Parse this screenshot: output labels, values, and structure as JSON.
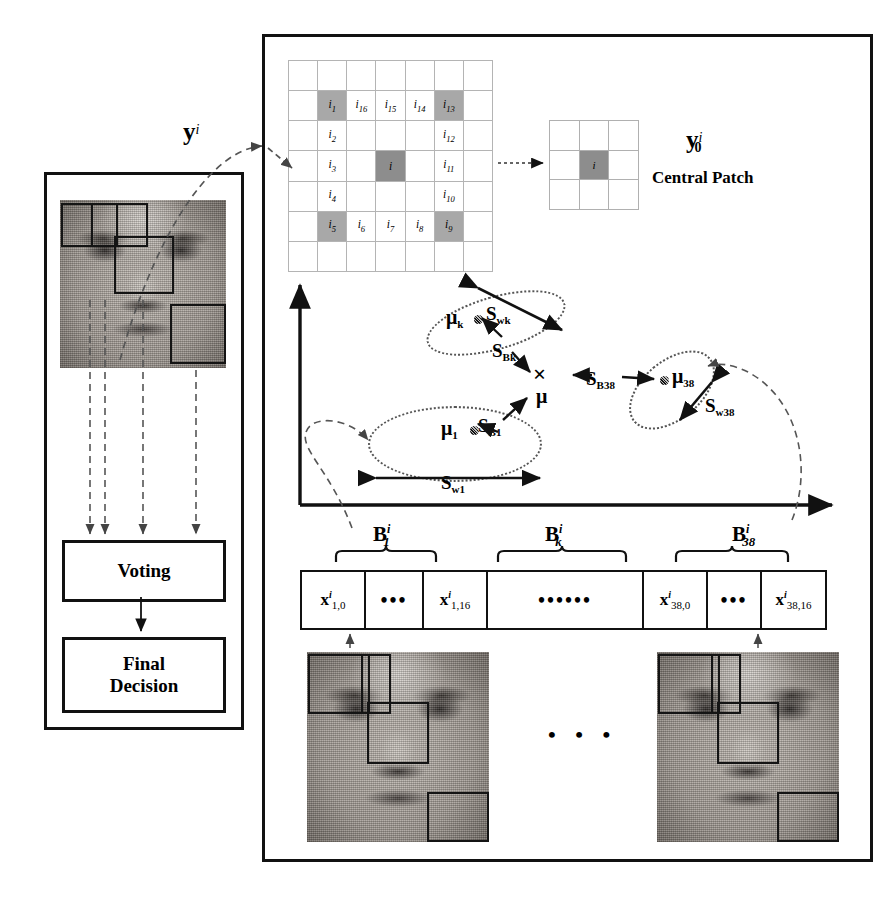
{
  "figure": {
    "domain": "scientific-diagram",
    "topic": "Patch based face recognition with LDA scatter and voting"
  },
  "left_panel": {
    "probe_label": "y",
    "probe_sup": "i",
    "voting_label": "Voting",
    "final_decision_label_line1": "Final",
    "final_decision_label_line2": "Decision"
  },
  "neighbourhood_grid": {
    "rows": 7,
    "cols": 7,
    "center_label": "i",
    "cells": [
      {
        "r": 2,
        "c": 2,
        "label": "i",
        "sub": "1",
        "shaded": true
      },
      {
        "r": 2,
        "c": 3,
        "label": "i",
        "sub": "16",
        "shaded": false
      },
      {
        "r": 2,
        "c": 4,
        "label": "i",
        "sub": "15",
        "shaded": false
      },
      {
        "r": 2,
        "c": 5,
        "label": "i",
        "sub": "14",
        "shaded": false
      },
      {
        "r": 2,
        "c": 6,
        "label": "i",
        "sub": "13",
        "shaded": true
      },
      {
        "r": 3,
        "c": 2,
        "label": "i",
        "sub": "2",
        "shaded": false
      },
      {
        "r": 3,
        "c": 6,
        "label": "i",
        "sub": "12",
        "shaded": false
      },
      {
        "r": 4,
        "c": 2,
        "label": "i",
        "sub": "3",
        "shaded": false
      },
      {
        "r": 4,
        "c": 6,
        "label": "i",
        "sub": "11",
        "shaded": false
      },
      {
        "r": 5,
        "c": 2,
        "label": "i",
        "sub": "4",
        "shaded": false
      },
      {
        "r": 5,
        "c": 6,
        "label": "i",
        "sub": "10",
        "shaded": false
      },
      {
        "r": 6,
        "c": 2,
        "label": "i",
        "sub": "5",
        "shaded": true
      },
      {
        "r": 6,
        "c": 3,
        "label": "i",
        "sub": "6",
        "shaded": false
      },
      {
        "r": 6,
        "c": 4,
        "label": "i",
        "sub": "7",
        "shaded": false
      },
      {
        "r": 6,
        "c": 5,
        "label": "i",
        "sub": "8",
        "shaded": false
      },
      {
        "r": 6,
        "c": 6,
        "label": "i",
        "sub": "9",
        "shaded": true
      }
    ]
  },
  "central_patch": {
    "center_label": "i",
    "symbol": "y",
    "symbol_sup": "i",
    "symbol_sub": "0",
    "caption": "Central Patch"
  },
  "scatter": {
    "global_mean_symbol": "×",
    "global_mean_label": "μ",
    "classes": [
      {
        "name": "class-1",
        "mean_label": "μ",
        "mean_sub": "1",
        "within_label": "S",
        "within_sub": "w1",
        "between_label": "S",
        "between_sub": "B1"
      },
      {
        "name": "class-k",
        "mean_label": "μ",
        "mean_sub": "k",
        "within_label": "S",
        "within_sub": "wk",
        "between_label": "S",
        "between_sub": "Bk"
      },
      {
        "name": "class-38",
        "mean_label": "μ",
        "mean_sub": "38",
        "within_label": "S",
        "within_sub": "w38",
        "between_label": "S",
        "between_sub": "B38"
      }
    ]
  },
  "feature_vector": {
    "groups": [
      {
        "label": "B",
        "sup": "i",
        "sub": "1"
      },
      {
        "label": "B",
        "sup": "i",
        "sub": "k"
      },
      {
        "label": "B",
        "sup": "i",
        "sub": "38"
      }
    ],
    "cells": [
      {
        "label": "x",
        "sup": "i",
        "sub": "1,0",
        "type": "value"
      },
      {
        "label": "•••",
        "type": "ellipsis"
      },
      {
        "label": "x",
        "sup": "i",
        "sub": "1,16",
        "type": "value"
      },
      {
        "label": "••••••",
        "type": "ellipsis-wide"
      },
      {
        "label": "x",
        "sup": "i",
        "sub": "38,0",
        "type": "value"
      },
      {
        "label": "•••",
        "type": "ellipsis"
      },
      {
        "label": "x",
        "sup": "i",
        "sub": "38,16",
        "type": "value"
      }
    ]
  },
  "training_faces": {
    "separator": "•  •  •",
    "count_shown": 2
  },
  "colors": {
    "ink": "#111111",
    "grid_line": "#b4b4b4",
    "shaded_cell": "#a8a8a8",
    "core_cell": "#8d8d8d",
    "ellipse": "#555555",
    "dashed_guide": "#555555"
  }
}
